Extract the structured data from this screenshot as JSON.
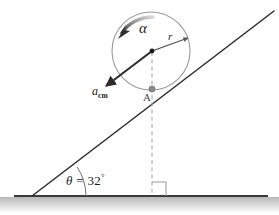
{
  "figure": {
    "background_color": "#ffffff"
  },
  "labels": {
    "angular_acceleration": "α",
    "radius": "r",
    "acceleration_cm_symbol": "a",
    "acceleration_cm_subscript": "cm",
    "contact_point": "A",
    "angle_symbol": "θ",
    "angle_equals": "=",
    "angle_value": "32",
    "angle_degree_symbol": "°"
  },
  "geometry": {
    "incline_angle_degrees": 32,
    "circle_center_x": 151,
    "circle_center_y": 51,
    "circle_radius": 39,
    "ground_line_y": 196,
    "incline_base_x": 32,
    "incline_top_x": 274,
    "incline_top_y": 11
  },
  "colors": {
    "stroke_dark": "#2b2b2b",
    "stroke_circle": "#9a9a9a",
    "stroke_dashed": "#a9a9a9",
    "point_gray": "#8c8c8c",
    "ground_dark": "#3a3a3a",
    "arc_gray": "#8f8f8f",
    "text": "#1a1a1a"
  },
  "elements": {
    "ground_line": "ground-line",
    "incline_line": "incline-line",
    "ball_circle": "ball-circle",
    "center_dot": "center-dot",
    "contact_dot": "contact-dot",
    "radius_arrow": "radius-arrow",
    "acceleration_arrow": "acceleration-arrow",
    "angular_acceleration_arrow": "angular-acceleration-arrow",
    "dashed_vertical": "dashed-vertical-line",
    "right_angle_marker": "right-angle-marker",
    "angle_arc": "angle-arc"
  }
}
